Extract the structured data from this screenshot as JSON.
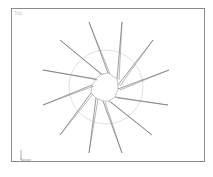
{
  "viewport": {
    "label": "Top",
    "border_color": "#8a8a8a",
    "background": "#ffffff"
  },
  "scene": {
    "object": "star-spline",
    "line_color": "#707070",
    "circle_color": "#d8d8d8",
    "circle": {
      "cx": 106,
      "cy": 87,
      "r": 37
    },
    "spikes": [
      {
        "tip": [
          89,
          22
        ],
        "base": [
          108,
          73
        ]
      },
      {
        "tip": [
          122,
          22
        ],
        "base": [
          117,
          79
        ]
      },
      {
        "tip": [
          153,
          40
        ],
        "base": [
          118,
          85
        ]
      },
      {
        "tip": [
          169,
          70
        ],
        "base": [
          118,
          89
        ]
      },
      {
        "tip": [
          168,
          105
        ],
        "base": [
          115,
          97
        ]
      },
      {
        "tip": [
          152,
          135
        ],
        "base": [
          109,
          101
        ]
      },
      {
        "tip": [
          122,
          153
        ],
        "base": [
          103,
          101
        ]
      },
      {
        "tip": [
          89,
          153
        ],
        "base": [
          96,
          98
        ]
      },
      {
        "tip": [
          60,
          135
        ],
        "base": [
          91,
          93
        ]
      },
      {
        "tip": [
          43,
          105
        ],
        "base": [
          92,
          85
        ]
      },
      {
        "tip": [
          43,
          70
        ],
        "base": [
          96,
          79
        ]
      },
      {
        "tip": [
          60,
          40
        ],
        "base": [
          101,
          74
        ]
      }
    ]
  },
  "axis_gizmo": {
    "x_label": "x",
    "y_label": "y"
  }
}
